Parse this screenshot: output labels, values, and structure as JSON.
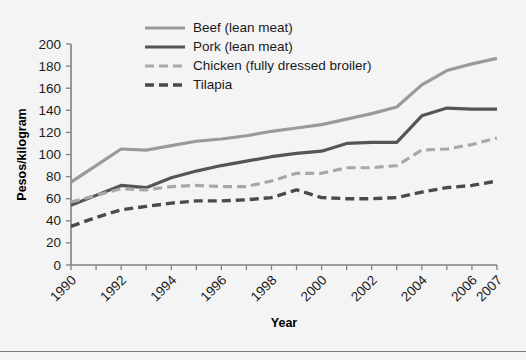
{
  "chart_data": {
    "type": "line",
    "title": "",
    "xlabel": "Year",
    "ylabel": "Pesos/kilogram",
    "xlim": [
      1990,
      2007
    ],
    "ylim": [
      0,
      200
    ],
    "ytick_step": 20,
    "yticks": [
      0,
      20,
      40,
      60,
      80,
      100,
      120,
      140,
      160,
      180,
      200
    ],
    "xticks": [
      1990,
      1991,
      1992,
      1993,
      1994,
      1995,
      1996,
      1997,
      1998,
      1999,
      2000,
      2001,
      2002,
      2003,
      2004,
      2005,
      2006,
      2007
    ],
    "xtick_labels": [
      "1990",
      "",
      "1992",
      "",
      "1994",
      "",
      "1996",
      "",
      "1998",
      "",
      "2000",
      "",
      "2002",
      "",
      "2004",
      "",
      "2006",
      "2007"
    ],
    "xtick_labels_shown": [
      "1990",
      "1992",
      "1994",
      "1996",
      "1998",
      "2000",
      "2002",
      "2004",
      "2006",
      "2007"
    ],
    "xtick_label_rotation": -45,
    "grid": false,
    "legend_position": "top-center",
    "x": [
      1990,
      1991,
      1992,
      1993,
      1994,
      1995,
      1996,
      1997,
      1998,
      1999,
      2000,
      2001,
      2002,
      2003,
      2004,
      2005,
      2006,
      2007
    ],
    "series": [
      {
        "name": "Beef (lean meat)",
        "color": "#9a9a9a",
        "style": "solid",
        "width": 3.2,
        "values": [
          75,
          90,
          105,
          104,
          108,
          112,
          114,
          117,
          121,
          124,
          127,
          132,
          137,
          143,
          163,
          176,
          182,
          187
        ]
      },
      {
        "name": "Pork (lean meat)",
        "color": "#555555",
        "style": "solid",
        "width": 3.2,
        "values": [
          54,
          63,
          72,
          70,
          79,
          85,
          90,
          94,
          98,
          101,
          103,
          110,
          111,
          111,
          135,
          142,
          141,
          141
        ]
      },
      {
        "name": "Chicken (fully dressed broiler)",
        "color": "#a8a8a8",
        "style": "dashed",
        "width": 3.2,
        "values": [
          57,
          63,
          69,
          68,
          71,
          72,
          71,
          71,
          76,
          83,
          83,
          88,
          88,
          90,
          104,
          105,
          109,
          115
        ]
      },
      {
        "name": "Tilapia",
        "color": "#4a4a4a",
        "style": "dashed",
        "width": 3.4,
        "values": [
          35,
          43,
          50,
          53,
          56,
          58,
          58,
          59,
          61,
          68,
          61,
          60,
          60,
          61,
          66,
          70,
          72,
          76
        ]
      }
    ]
  },
  "legend": {
    "items": [
      {
        "label": "Beef (lean meat)"
      },
      {
        "label": "Pork (lean meat)"
      },
      {
        "label": "Chicken (fully dressed broiler)"
      },
      {
        "label": "Tilapia"
      }
    ]
  },
  "axes": {
    "y_title": "Pesos/kilogram",
    "x_title": "Year"
  }
}
